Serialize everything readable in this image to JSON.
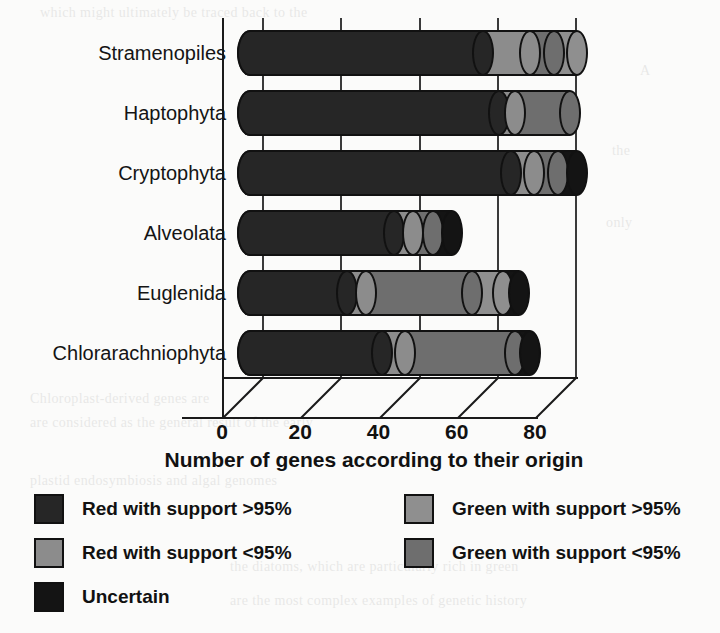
{
  "chart_data": {
    "type": "bar",
    "orientation": "horizontal",
    "stacked": true,
    "style": "3d-cylinder",
    "title": "",
    "xlabel": "Number of genes according to their origin",
    "ylabel": "",
    "xlim": [
      0,
      90
    ],
    "xticks": [
      0,
      20,
      40,
      60,
      80
    ],
    "xtick_labels": [
      "0",
      "20",
      "40",
      "60",
      "80"
    ],
    "grid": true,
    "grid_axis": "x",
    "legend_position": "below",
    "categories": [
      "Stramenopiles",
      "Haptophyta",
      "Cryptophyta",
      "Alveolata",
      "Euglenida",
      "Chlorarachniophyta"
    ],
    "series": [
      {
        "name": "Red with support >95%",
        "key": "red_high",
        "color": "#262626",
        "values": [
          63,
          67,
          70,
          40,
          28,
          37
        ]
      },
      {
        "name": "Red with support <95%",
        "key": "red_low",
        "color": "#8c8c8c",
        "values": [
          12,
          4,
          6,
          5,
          5,
          6
        ]
      },
      {
        "name": "Green with support >95%",
        "key": "green_high",
        "color": "#6e6e6e",
        "values": [
          6,
          14,
          6,
          5,
          27,
          28
        ]
      },
      {
        "name": "Green with support <95%",
        "key": "green_low",
        "color": "#8f8f8f",
        "values": [
          6,
          0,
          0,
          0,
          8,
          0
        ]
      },
      {
        "name": "Uncertain",
        "key": "uncertain",
        "color": "#141414",
        "values": [
          0,
          0,
          5,
          5,
          4,
          4
        ]
      }
    ],
    "totals": [
      87,
      85,
      87,
      55,
      72,
      75
    ],
    "annotations": []
  },
  "legend": {
    "left_items": [
      {
        "label": "Red with support >95%",
        "color": "#262626"
      },
      {
        "label": "Red with support <95%",
        "color": "#8c8c8c"
      },
      {
        "label": "Uncertain",
        "color": "#141414"
      }
    ],
    "right_items": [
      {
        "label": "Green with support >95%",
        "color": "#8f8f8f"
      },
      {
        "label": "Green with support <95%",
        "color": "#6e6e6e"
      }
    ]
  },
  "background_text": [
    "which might ultimately be traced back to the",
    "A",
    "the",
    "only",
    "Chloroplast-derived genes are",
    "are considered as the general result of the early",
    "plastid endosymbiosis  and  algal  genomes",
    "the diatoms, which are particularly rich in green",
    "are the  most  complex  examples  of  genetic  history"
  ]
}
